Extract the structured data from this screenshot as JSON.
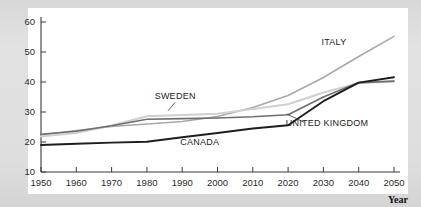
{
  "figure": {
    "background_color": "#dcdcdc",
    "plot_background_color": "#ffffff",
    "axis_color": "#3a3a3a"
  },
  "chart_data": {
    "type": "line",
    "title": "",
    "subtitle": "",
    "xlabel": "Year",
    "ylabel": "",
    "xlim": [
      1950,
      2050
    ],
    "ylim": [
      10,
      60
    ],
    "grid": false,
    "legend": "inline-labels",
    "x": [
      1950,
      1960,
      1970,
      1980,
      1990,
      2000,
      2010,
      2020,
      2030,
      2040,
      2050
    ],
    "xticks": [
      "1950",
      "1960",
      "1970",
      "1980",
      "1990",
      "2000",
      "2010",
      "2020",
      "2030",
      "2040",
      "2050"
    ],
    "yticks": [
      "10",
      "20",
      "30",
      "40",
      "50",
      "60"
    ],
    "series": [
      {
        "name": "ITALY",
        "color": "#a8a8a8",
        "width": 1.5,
        "values": [
          22.3,
          23.8,
          25.2,
          26.0,
          26.8,
          28.5,
          31.5,
          35.5,
          41.5,
          48.5,
          55.2
        ],
        "label_x": 2033,
        "label_y": 52.5,
        "leader": null
      },
      {
        "name": "SWEDEN",
        "color": "#d0d0d0",
        "width": 2.0,
        "values": [
          21.8,
          23.0,
          25.5,
          28.6,
          29.0,
          29.4,
          31.0,
          32.6,
          36.5,
          39.6,
          40.2
        ],
        "label_x": 1988,
        "label_y": 34.5,
        "leader": {
          "x1": 1988,
          "y1": 33.2,
          "x2": 1986,
          "y2": 30.4
        }
      },
      {
        "name": "UNITED KINGDOM",
        "color": "#6e6e6e",
        "width": 1.6,
        "values": [
          22.6,
          23.6,
          25.4,
          27.6,
          27.8,
          28.0,
          28.4,
          29.1,
          35.0,
          39.8,
          40.3
        ],
        "label_x": 2031,
        "label_y": 25.3,
        "leader": {
          "x1": 2024.5,
          "y1": 26.6,
          "x2": 2019.5,
          "y2": 29.4
        }
      },
      {
        "name": "CANADA",
        "color": "#1e1e1e",
        "width": 1.9,
        "values": [
          19.0,
          19.4,
          19.8,
          20.1,
          21.6,
          23.0,
          24.5,
          25.6,
          33.6,
          39.8,
          41.6
        ],
        "label_x": 1995,
        "label_y": 19.0,
        "leader": null
      }
    ]
  }
}
